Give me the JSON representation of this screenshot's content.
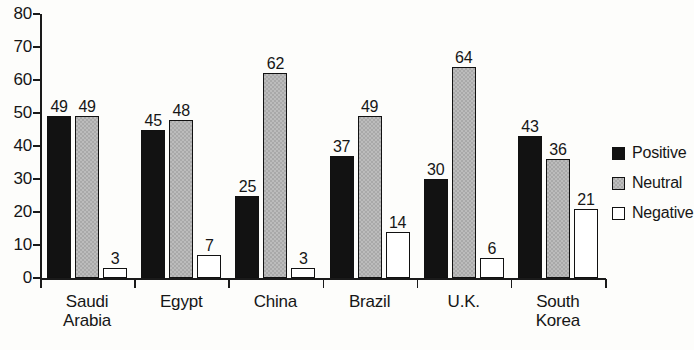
{
  "chart_data": {
    "type": "bar",
    "title": "",
    "xlabel": "",
    "ylabel": "",
    "ylim": [
      0,
      80
    ],
    "yticks": [
      0,
      10,
      20,
      30,
      40,
      50,
      60,
      70,
      80
    ],
    "grid": false,
    "legend_position": "right",
    "categories": [
      "Saudi Arabia",
      "Egypt",
      "China",
      "Brazil",
      "U.K.",
      "South Korea"
    ],
    "category_lines": [
      [
        "Saudi",
        "Arabia"
      ],
      [
        "Egypt"
      ],
      [
        "China"
      ],
      [
        "Brazil"
      ],
      [
        "U.K."
      ],
      [
        "South",
        "Korea"
      ]
    ],
    "series": [
      {
        "name": "Positive",
        "color": "#121212",
        "values": [
          49,
          45,
          25,
          37,
          30,
          43
        ]
      },
      {
        "name": "Neutral",
        "color": "#a9a9a9",
        "values": [
          49,
          48,
          62,
          49,
          64,
          36
        ]
      },
      {
        "name": "Negative",
        "color": "#ffffff",
        "values": [
          3,
          7,
          3,
          14,
          6,
          21
        ]
      }
    ]
  },
  "legend": {
    "items": [
      {
        "label": "Positive",
        "swatch": "positive"
      },
      {
        "label": "Neutral",
        "swatch": "neutral"
      },
      {
        "label": "Negative",
        "swatch": "negative"
      }
    ]
  }
}
